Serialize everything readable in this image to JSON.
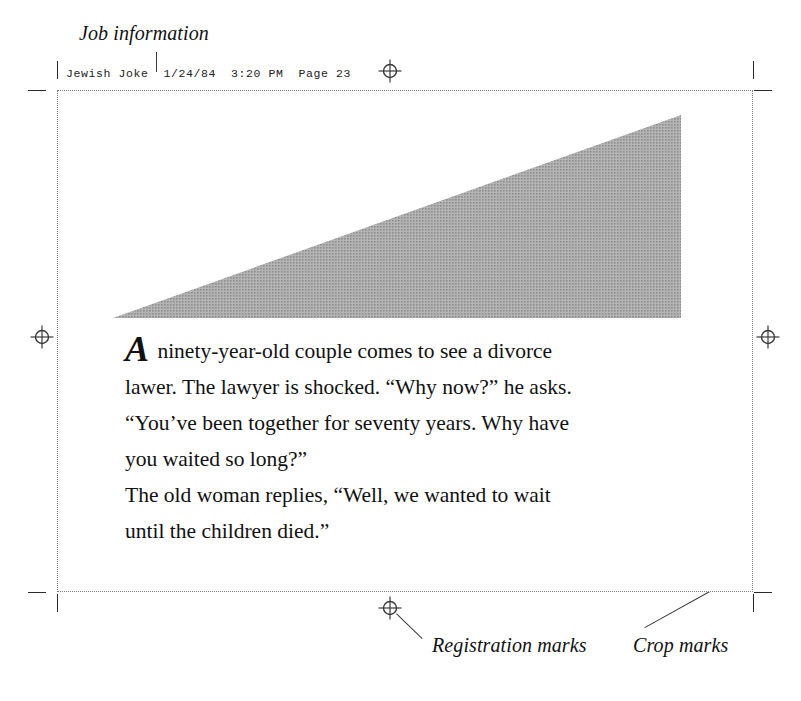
{
  "annotations": {
    "job_information": "Job information",
    "registration_marks": "Registration marks",
    "crop_marks": "Crop marks"
  },
  "job_info_line": {
    "full_text": "Jewish Joke  1/24/84  3:20 PM  Page 23",
    "document_name": "Jewish Joke",
    "date": "1/24/84",
    "time": "3:20 PM",
    "page_label": "Page 23"
  },
  "artwork": {
    "shape": "right-triangle",
    "fill_color": "#a3a3a3",
    "description": "gray halftone triangle"
  },
  "body_copy": {
    "dropcap": "A",
    "line1_rest": " ninety-year-old couple comes to see a divorce",
    "line2": "lawer. The lawyer is shocked. “Why now?” he asks.",
    "line3": "“You’ve been together for seventy years. Why have",
    "line4": "you waited so long?”",
    "line5": "The old woman replies, “Well, we wanted to wait",
    "line6": "until the children died.”"
  },
  "marks": {
    "crop_mark_color": "#2b2b2b",
    "registration_mark_color": "#3a3a3a",
    "page_boundary_color": "#7a7a7a"
  }
}
